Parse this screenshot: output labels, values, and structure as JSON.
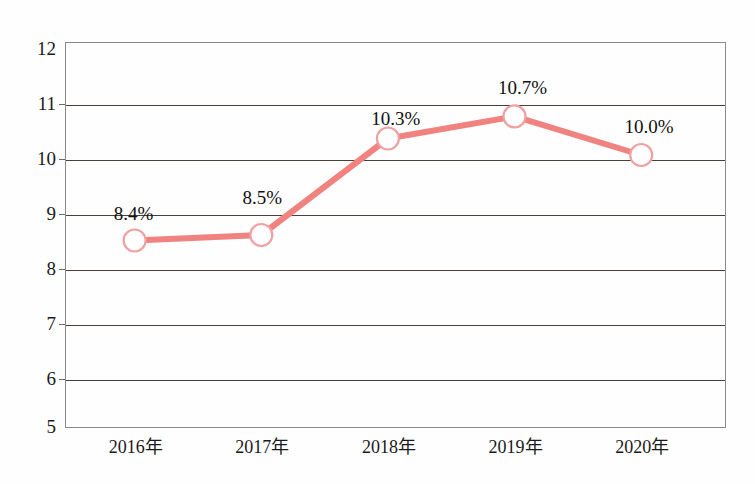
{
  "chart_data": {
    "type": "line",
    "title": "",
    "subtitle": "",
    "xlabel": "",
    "ylabel": "",
    "categories": [
      "2016年",
      "2017年",
      "2018年",
      "2019年",
      "2020年"
    ],
    "values": [
      8.4,
      8.5,
      10.25,
      10.65,
      9.95
    ],
    "point_labels": [
      "8.4%",
      "8.5%",
      "10.3%",
      "10.7%",
      "10.0%"
    ],
    "series": [
      {
        "name": "",
        "values": [
          8.4,
          8.5,
          10.25,
          10.65,
          9.95
        ],
        "labels": [
          "8.4%",
          "8.5%",
          "10.3%",
          "10.7%",
          "10.0%"
        ],
        "line_color": "#F0827F",
        "marker": "circle",
        "marker_fill": "#FFFFFF",
        "marker_edge": "#F0A0A0"
      }
    ],
    "ylim": [
      5,
      12
    ],
    "yticks": [
      5,
      6,
      7,
      8,
      9,
      10,
      11,
      12
    ],
    "ytick_labels": [
      "5",
      "6",
      "7",
      "8",
      "9",
      "10",
      "11",
      "12"
    ],
    "grid": true,
    "grid_color": "#4a4038",
    "legend": false,
    "legend_position": "none",
    "frame_color": "#8a8a8a",
    "background": "#ffffff"
  },
  "axis": {
    "y_labels": [
      "12",
      "11",
      "10",
      "9",
      "8",
      "7",
      "6",
      "5"
    ],
    "x_labels": [
      "2016年",
      "2017年",
      "2018年",
      "2019年",
      "2020年"
    ]
  },
  "labels": {
    "p0": "8.4%",
    "p1": "8.5%",
    "p2": "10.3%",
    "p3": "10.7%",
    "p4": "10.0%"
  }
}
